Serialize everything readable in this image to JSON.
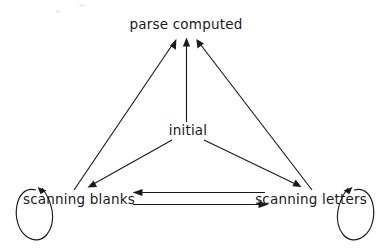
{
  "diagram": {
    "type": "state-transition-diagram",
    "background_color": "#ffffff",
    "ink_color": "#1a1a1a",
    "nodes": [
      {
        "id": "parse_computed",
        "label": "parse computed",
        "x": 186,
        "y": 25
      },
      {
        "id": "initial",
        "label": "initial",
        "x": 188,
        "y": 131
      },
      {
        "id": "scanning_blanks",
        "label": "scanning blanks",
        "x": 79,
        "y": 200
      },
      {
        "id": "scanning_letters",
        "label": "scanning letters",
        "x": 311,
        "y": 200
      }
    ],
    "edges": [
      {
        "from": "initial",
        "to": "parse_computed",
        "shape": "straight-vertical"
      },
      {
        "from": "initial",
        "to": "scanning_blanks",
        "shape": "straight-diagonal"
      },
      {
        "from": "initial",
        "to": "scanning_letters",
        "shape": "straight-diagonal"
      },
      {
        "from": "scanning_blanks",
        "to": "parse_computed",
        "shape": "straight-diagonal"
      },
      {
        "from": "scanning_letters",
        "to": "parse_computed",
        "shape": "straight-diagonal"
      },
      {
        "from": "scanning_letters",
        "to": "scanning_blanks",
        "shape": "horizontal-upper"
      },
      {
        "from": "scanning_blanks",
        "to": "scanning_letters",
        "shape": "horizontal-lower"
      },
      {
        "from": "scanning_blanks",
        "to": "scanning_blanks",
        "shape": "self-loop-left"
      },
      {
        "from": "scanning_letters",
        "to": "scanning_letters",
        "shape": "self-loop-right"
      }
    ]
  }
}
